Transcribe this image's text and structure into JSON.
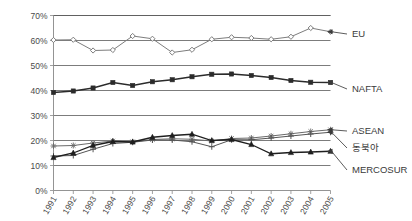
{
  "chart_data": {
    "type": "line",
    "title": "",
    "subtitle": "",
    "xlabel": "",
    "ylabel": "",
    "grid": true,
    "legend_position": "right-inline",
    "ylim": [
      0,
      70
    ],
    "ytick_labels": [
      "0%",
      "10%",
      "20%",
      "30%",
      "40%",
      "50%",
      "60%",
      "70%"
    ],
    "ytick_values": [
      0,
      10,
      20,
      30,
      40,
      50,
      60,
      70
    ],
    "categories": [
      "1991",
      "1992",
      "1993",
      "1994",
      "1995",
      "1996",
      "1997",
      "1998",
      "1999",
      "2000",
      "2001",
      "2002",
      "2003",
      "2004",
      "2005"
    ],
    "series": [
      {
        "name": "EU",
        "label": "EU",
        "color": "#7d7d7d",
        "marker": "diamond",
        "values": [
          60.2,
          60.3,
          56.0,
          56.2,
          61.8,
          60.7,
          55.2,
          56.3,
          60.5,
          61.3,
          61.0,
          60.5,
          61.5,
          65.0,
          63.5
        ]
      },
      {
        "name": "NAFTA",
        "label": "NAFTA",
        "color": "#2b2b2b",
        "marker": "square",
        "values": [
          39.2,
          39.8,
          41.0,
          43.2,
          42.0,
          43.5,
          44.3,
          45.5,
          46.5,
          46.6,
          46.0,
          45.2,
          44.0,
          43.3,
          43.2
        ]
      },
      {
        "name": "ASEAN",
        "label": "ASEAN",
        "color": "#6a6a6a",
        "marker": "star",
        "values": [
          17.8,
          18.0,
          19.0,
          19.8,
          19.5,
          20.4,
          20.7,
          20.5,
          19.8,
          20.8,
          21.0,
          21.8,
          22.7,
          23.6,
          24.3
        ]
      },
      {
        "name": "동북아",
        "label": "동북아",
        "color": "#555555",
        "marker": "plus",
        "values": [
          13.8,
          14.0,
          16.5,
          18.8,
          19.3,
          20.2,
          20.2,
          19.5,
          17.5,
          20.3,
          20.3,
          21.0,
          21.8,
          22.6,
          23.3
        ]
      },
      {
        "name": "MERCOSUR",
        "label": "MERCOSUR",
        "color": "#1f1f1f",
        "marker": "triangle",
        "values": [
          13.2,
          15.0,
          18.0,
          19.6,
          19.4,
          21.3,
          22.0,
          22.5,
          20.0,
          20.4,
          18.4,
          14.7,
          15.2,
          15.4,
          15.7
        ]
      }
    ],
    "legend_entries": [
      {
        "label": "EU",
        "anchor_value": 63.5
      },
      {
        "label": "NAFTA",
        "anchor_value": 43.2
      },
      {
        "label": "ASEAN",
        "anchor_value": 24.3
      },
      {
        "label": "동북아",
        "anchor_value": 23.3
      },
      {
        "label": "MERCOSUR",
        "anchor_value": 15.7
      }
    ]
  }
}
